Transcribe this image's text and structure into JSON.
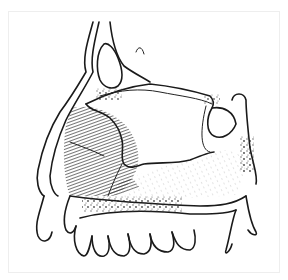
{
  "figure": {
    "colors": {
      "background": "#ffffff",
      "frame_border": "#eeeeee",
      "ink": "#1a1a1a",
      "hatch": "#333333",
      "stipple": "#555555"
    }
  }
}
